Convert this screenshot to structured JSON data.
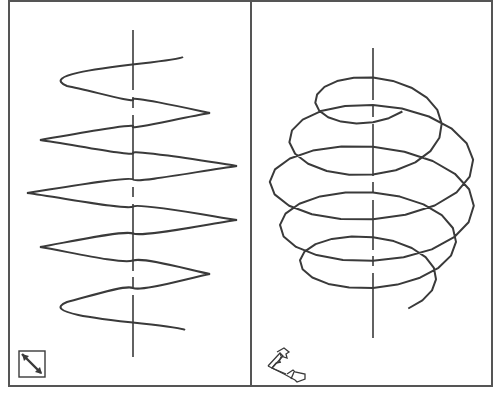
{
  "figure": {
    "frame": {
      "x": 9,
      "y": 1,
      "width": 483,
      "height": 385,
      "stroke": "#555555"
    },
    "divider_x": 251,
    "colors": {
      "line": "#3a3a3a",
      "frame": "#555555",
      "background": "#ffffff"
    }
  },
  "panels": [
    {
      "name": "side-view",
      "axis": {
        "x": 133,
        "y1": 30,
        "y2": 357,
        "dashed_segments": [
          [
            30,
            90
          ],
          [
            97,
            108
          ],
          [
            115,
            180
          ],
          [
            187,
            197
          ],
          [
            204,
            271
          ],
          [
            277,
            287
          ],
          [
            295,
            357
          ]
        ]
      },
      "helix": {
        "type": "sine",
        "center_x": 133,
        "y_start": 57,
        "y_end": 330,
        "turns": 5,
        "amplitudes": [
          50,
          77,
          104,
          104,
          104,
          104,
          104,
          77,
          50
        ],
        "peaks": [
          [
            183,
            57
          ],
          [
            67,
            86
          ],
          [
            210,
            113
          ],
          [
            40,
            140
          ],
          [
            237,
            166
          ],
          [
            27,
            193
          ],
          [
            237,
            220
          ],
          [
            40,
            247
          ],
          [
            210,
            274
          ],
          [
            67,
            302
          ],
          [
            185,
            330
          ]
        ]
      },
      "view_icon": {
        "name": "diagonal-arrow-icon",
        "x": 19,
        "y": 351,
        "size": 26
      }
    },
    {
      "name": "oblique-view",
      "axis": {
        "x": 373,
        "y1": 48,
        "y2": 338
      },
      "helix": {
        "type": "polygonal-spiral",
        "center_x": 373,
        "segments_per_turn": 20,
        "loops": [
          {
            "cy": 88,
            "rx": 50,
            "ry": 29
          },
          {
            "cy": 130,
            "rx": 72,
            "ry": 40
          },
          {
            "cy": 165,
            "rx": 105,
            "ry": 50
          },
          {
            "cy": 213,
            "rx": 100,
            "ry": 45
          },
          {
            "cy": 247,
            "rx": 80,
            "ry": 38
          },
          {
            "cy": 285,
            "rx": 60,
            "ry": 29
          }
        ],
        "start": [
          418,
          92
        ],
        "end": [
          418,
          333
        ]
      },
      "view_icon": {
        "name": "3d-axes-icon",
        "x": 267,
        "y": 348,
        "size": 44
      }
    }
  ]
}
